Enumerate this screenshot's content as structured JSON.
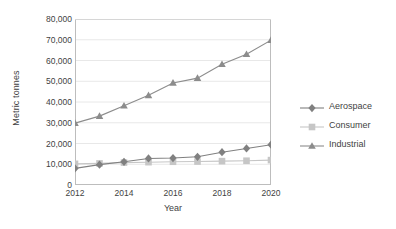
{
  "chart_data": {
    "type": "line",
    "title": "",
    "xlabel": "Year",
    "ylabel": "Metric tonnes",
    "x": [
      2012,
      2013,
      2014,
      2015,
      2016,
      2017,
      2018,
      2019,
      2020
    ],
    "xtick_labels": [
      "2012",
      "2014",
      "2016",
      "2018",
      "2020"
    ],
    "xticks": [
      2012,
      2014,
      2016,
      2018,
      2020
    ],
    "xlim": [
      2012,
      2020
    ],
    "ytick_labels": [
      "0",
      "10,000",
      "20,000",
      "30,000",
      "40,000",
      "50,000",
      "60,000",
      "70,000",
      "80,000"
    ],
    "yticks": [
      0,
      10000,
      20000,
      30000,
      40000,
      50000,
      60000,
      70000,
      80000
    ],
    "ylim": [
      0,
      80000
    ],
    "grid": "horizontal",
    "legend_position": "right",
    "series": [
      {
        "name": "Aerospace",
        "marker": "diamond",
        "color": "#808080",
        "values": [
          8000,
          9800,
          11200,
          12800,
          13000,
          13600,
          15800,
          17600,
          19400
        ]
      },
      {
        "name": "Consumer",
        "marker": "square",
        "color": "#c6c6c6",
        "values": [
          10200,
          10400,
          10800,
          11000,
          11200,
          11300,
          11500,
          11700,
          12000
        ]
      },
      {
        "name": "Industrial",
        "marker": "triangle",
        "color": "#8c8c8c",
        "values": [
          29800,
          33200,
          38200,
          43200,
          49200,
          51500,
          58200,
          63000,
          69800
        ]
      }
    ]
  }
}
